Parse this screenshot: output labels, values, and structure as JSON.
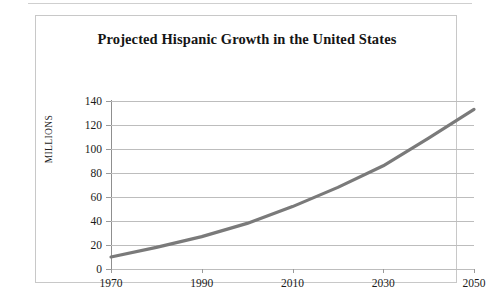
{
  "chart_data": {
    "type": "line",
    "title": "Projected Hispanic Growth in the United States",
    "xlabel": "",
    "ylabel": "MILLIONS",
    "xlim": [
      1970,
      2050
    ],
    "ylim": [
      0,
      140
    ],
    "xticks": [
      "1970",
      "1990",
      "2010",
      "2030",
      "2050"
    ],
    "yticks": [
      "0",
      "20",
      "40",
      "60",
      "80",
      "100",
      "120",
      "140"
    ],
    "grid": "horizontal",
    "legend": "none",
    "series": [
      {
        "name": "Hispanic population (millions)",
        "color": "#7a7a7a",
        "x": [
          1970,
          1980,
          1990,
          2000,
          2010,
          2020,
          2030,
          2040,
          2050
        ],
        "values": [
          10,
          18,
          27,
          38,
          52,
          68,
          86,
          109,
          133
        ]
      }
    ]
  },
  "chart": {
    "title": "Projected Hispanic Growth in the United States",
    "y_axis_title": "MILLIONS"
  }
}
